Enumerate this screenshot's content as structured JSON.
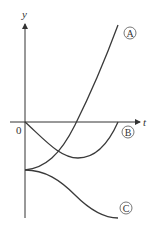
{
  "diagram": {
    "axes": {
      "y_label": "y",
      "x_label": "t",
      "origin_label": "0"
    },
    "curves": [
      {
        "id": "A",
        "label": "A",
        "description": "starts below origin on y-axis, increases steeply upward"
      },
      {
        "id": "B",
        "label": "B",
        "description": "starts at origin, dips to minimum below t-axis, returns to t-axis"
      },
      {
        "id": "C",
        "label": "C",
        "description": "starts below origin on y-axis (same point as A), decreases with S-shape"
      }
    ],
    "colors": {
      "line": "#3a3a3a",
      "background": "#ffffff"
    }
  }
}
